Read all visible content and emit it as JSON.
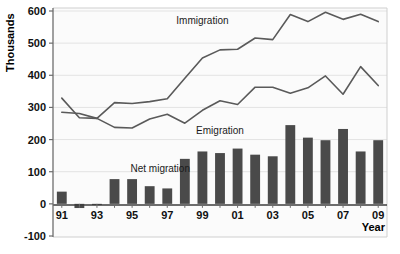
{
  "chart_data": {
    "type": "bar",
    "title": "",
    "xlabel": "Year",
    "ylabel": "Thousands",
    "categories": [
      "91",
      "92",
      "93",
      "94",
      "95",
      "96",
      "97",
      "98",
      "99",
      "00",
      "01",
      "02",
      "03",
      "04",
      "05",
      "06",
      "07",
      "08",
      "09"
    ],
    "x": [
      1991,
      1992,
      1993,
      1994,
      1995,
      1996,
      1997,
      1998,
      1999,
      2000,
      2001,
      2002,
      2003,
      2004,
      2005,
      2006,
      2007,
      2008,
      2009
    ],
    "ylim": [
      -100,
      600
    ],
    "yticks": [
      -100,
      0,
      100,
      200,
      300,
      400,
      500,
      600
    ],
    "ytick_labels": [
      "-100",
      "0",
      "100",
      "200",
      "300",
      "400",
      "500",
      "600"
    ],
    "grid": true,
    "legend": "inline-annotations",
    "series": [
      {
        "name": "Net migration",
        "type": "bar",
        "color": "#4a4a4a",
        "values": [
          38,
          -13,
          -1,
          77,
          77,
          55,
          48,
          140,
          163,
          158,
          172,
          153,
          148,
          245,
          206,
          198,
          233,
          163,
          198
        ]
      },
      {
        "name": "Immigration",
        "type": "line",
        "color": "#5a5a5a",
        "values": [
          329,
          268,
          266,
          315,
          312,
          318,
          327,
          391,
          454,
          479,
          481,
          516,
          511,
          589,
          567,
          596,
          574,
          590,
          567
        ]
      },
      {
        "name": "Emigration",
        "type": "line",
        "color": "#5a5a5a",
        "values": [
          285,
          281,
          266,
          238,
          236,
          264,
          279,
          251,
          291,
          321,
          309,
          363,
          363,
          344,
          361,
          398,
          341,
          427,
          368
        ]
      }
    ],
    "annotations": [
      {
        "name": "immigration-label",
        "text": "Immigration",
        "x": 1999,
        "y": 560
      },
      {
        "name": "emigration-label",
        "text": "Emigration",
        "x": 2000,
        "y": 218
      },
      {
        "name": "net-migration-label",
        "text": "Net migration",
        "x": 1995.6,
        "y": 100
      }
    ]
  },
  "axes": {
    "y_axis_title": "Thousands",
    "x_axis_title": "Year"
  },
  "colors": {
    "bar": "#4a4a4a",
    "line": "#5a5a5a",
    "plot_background": "#fbfbfb",
    "grid": "#e3e3e3",
    "axis": "#6d6d6d",
    "text": "#111111"
  }
}
